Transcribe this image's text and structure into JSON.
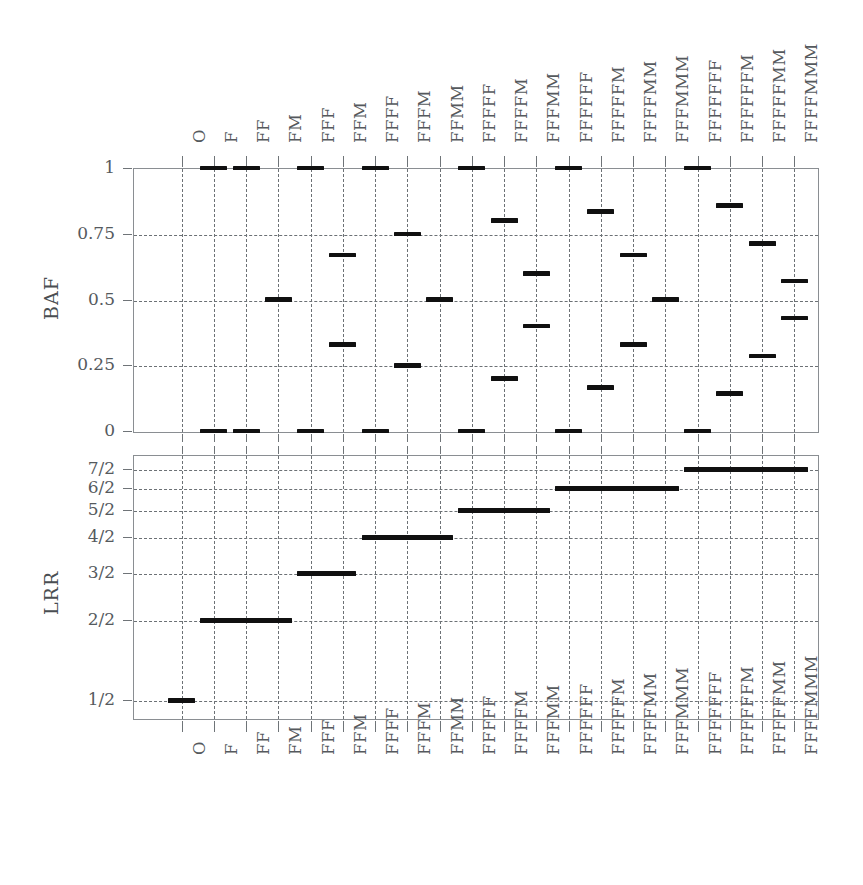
{
  "figure": {
    "type": "two-panel step plot",
    "background": "#ffffff",
    "line_color": "#101010",
    "grid_color": "#6c7175"
  },
  "categories": [
    "O",
    "F",
    "FF",
    "FM",
    "FFF",
    "FFM",
    "FFFF",
    "FFFM",
    "FFMM",
    "FFFFF",
    "FFFFM",
    "FFFMM",
    "FFFFFF",
    "FFFFFM",
    "FFFFMM",
    "FFFMMM",
    "FFFFFFF",
    "FFFFFFM",
    "FFFFFMM",
    "FFFFMMM"
  ],
  "axis_labels": {
    "top": [
      "O",
      "F",
      "FF",
      "FM",
      "FFF",
      "FFM",
      "FFFF",
      "FFFM",
      "FFMM",
      "FFFFF",
      "FFFFM",
      "FFFMM",
      "FFFFFF",
      "FFFFFM",
      "FFFFMM",
      "FFFMMM",
      "FFFFFFF",
      "FFFFFFM",
      "FFFFFMM",
      "FFFFMMM"
    ],
    "bottom": [
      "O",
      "F",
      "FF",
      "FM",
      "FFF",
      "FFM",
      "FFFF",
      "FFFM",
      "FFMM",
      "FFFFF",
      "FFFFM",
      "FFFMM",
      "FFFFFF",
      "FFFFFM",
      "FFFFMM",
      "FFFMMM",
      "FFFFFFF",
      "FFFFFFM",
      "FFFFFMM",
      "FFFFMMM"
    ]
  },
  "chart_data": [
    {
      "type": "line",
      "panel": "BAF",
      "ylabel": "BAF",
      "xlabel": "",
      "title": "",
      "ylim": [
        0,
        1
      ],
      "yticks": [
        0,
        0.25,
        0.5,
        0.75,
        1
      ],
      "ytick_labels": [
        "0",
        "0.25",
        "0.5",
        "0.75",
        "1"
      ],
      "grid": true,
      "categories": [
        "O",
        "F",
        "FF",
        "FM",
        "FFF",
        "FFM",
        "FFFF",
        "FFFM",
        "FFMM",
        "FFFFF",
        "FFFFM",
        "FFFMM",
        "FFFFFF",
        "FFFFFM",
        "FFFFMM",
        "FFFMMM",
        "FFFFFFF",
        "FFFFFFM",
        "FFFFFMM",
        "FFFFMMM"
      ],
      "values_per_category": [
        [],
        [
          0,
          1
        ],
        [
          0,
          1
        ],
        [
          0.5
        ],
        [
          0,
          1
        ],
        [
          0.33,
          0.67
        ],
        [
          0,
          1
        ],
        [
          0.25,
          0.75
        ],
        [
          0.5
        ],
        [
          0,
          1
        ],
        [
          0.2,
          0.8
        ],
        [
          0.4,
          0.6
        ],
        [
          0,
          1
        ],
        [
          0.165,
          0.835
        ],
        [
          0.33,
          0.67
        ],
        [
          0.5
        ],
        [
          0,
          1
        ],
        [
          0.143,
          0.857
        ],
        [
          0.286,
          0.714
        ],
        [
          0.43,
          0.57
        ]
      ]
    },
    {
      "type": "line",
      "panel": "LRR",
      "ylabel": "LRR",
      "xlabel": "",
      "title": "",
      "yticks": [
        "1/2",
        "2/2",
        "3/2",
        "4/2",
        "5/2",
        "6/2",
        "7/2"
      ],
      "ytick_labels": [
        "1/2",
        "2/2",
        "3/2",
        "4/2",
        "5/2",
        "6/2",
        "7/2"
      ],
      "grid": true,
      "categories": [
        "O",
        "F",
        "FF",
        "FM",
        "FFF",
        "FFM",
        "FFFF",
        "FFFM",
        "FFMM",
        "FFFFF",
        "FFFFM",
        "FFFMM",
        "FFFFFF",
        "FFFFFM",
        "FFFFMM",
        "FFFMMM",
        "FFFFFFF",
        "FFFFFFM",
        "FFFFFMM",
        "FFFFMMM"
      ],
      "level_per_category": [
        "1/2",
        "2/2",
        "2/2",
        "2/2",
        "3/2",
        "3/2",
        "4/2",
        "4/2",
        "4/2",
        "5/2",
        "5/2",
        "5/2",
        "6/2",
        "6/2",
        "6/2",
        "6/2",
        "7/2",
        "7/2",
        "7/2",
        "7/2"
      ],
      "steps": [
        {
          "level": "1/2",
          "from": "O",
          "to": "O"
        },
        {
          "level": "2/2",
          "from": "F",
          "to": "FM"
        },
        {
          "level": "3/2",
          "from": "FFF",
          "to": "FFM"
        },
        {
          "level": "4/2",
          "from": "FFFF",
          "to": "FFMM"
        },
        {
          "level": "5/2",
          "from": "FFFFF",
          "to": "FFFMM"
        },
        {
          "level": "6/2",
          "from": "FFFFFF",
          "to": "FFFMMM"
        },
        {
          "level": "7/2",
          "from": "FFFFFFF",
          "to": "FFFFMMM"
        }
      ]
    }
  ]
}
